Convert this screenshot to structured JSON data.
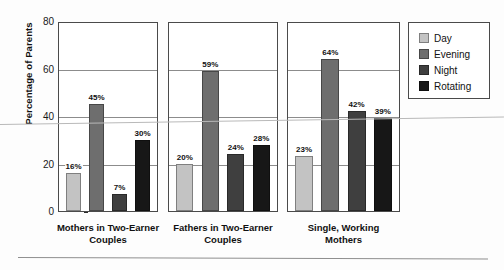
{
  "chart_data": {
    "type": "bar",
    "title": "",
    "xlabel": "",
    "ylabel": "Percentage of Parents",
    "ylim": [
      0,
      80
    ],
    "yticks": [
      0,
      20,
      40,
      60,
      80
    ],
    "grid": true,
    "legend_position": "right",
    "categories": [
      "Mothers in Two-Earner Couples",
      "Fathers in Two-Earner Couples",
      "Single, Working Mothers"
    ],
    "series": [
      {
        "name": "Day",
        "color": "#c3c3c3",
        "values": [
          16,
          20,
          23
        ]
      },
      {
        "name": "Evening",
        "color": "#6e6e6e",
        "values": [
          45,
          59,
          64
        ]
      },
      {
        "name": "Night",
        "color": "#3f3f3f",
        "values": [
          7,
          24,
          42
        ]
      },
      {
        "name": "Rotating",
        "color": "#171717",
        "values": [
          30,
          28,
          39
        ]
      }
    ],
    "value_labels": [
      [
        "16%",
        "45%",
        "7%",
        "30%"
      ],
      [
        "20%",
        "59%",
        "24%",
        "28%"
      ],
      [
        "23%",
        "64%",
        "42%",
        "39%"
      ]
    ]
  },
  "axis": {
    "y_title": "Percentage of Parents",
    "tick_labels": [
      "80",
      "60",
      "40",
      "20",
      "0"
    ]
  },
  "panels": [
    {
      "label_line1": "Mothers in Two-Earner",
      "label_line2": "Couples"
    },
    {
      "label_line1": "Fathers in Two-Earner",
      "label_line2": "Couples"
    },
    {
      "label_line1": "Single, Working",
      "label_line2": "Mothers"
    }
  ],
  "legend": {
    "items": [
      {
        "label": "Day",
        "color": "#c3c3c3"
      },
      {
        "label": "Evening",
        "color": "#6e6e6e"
      },
      {
        "label": "Night",
        "color": "#3f3f3f"
      },
      {
        "label": "Rotating",
        "color": "#171717"
      }
    ]
  }
}
